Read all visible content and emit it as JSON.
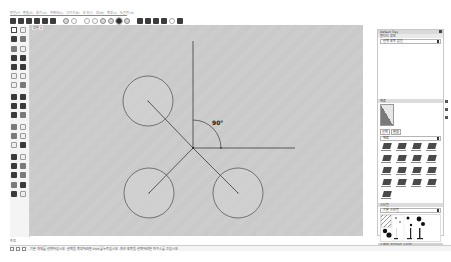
{
  "app": {
    "name": "SketchUp",
    "language": "ko"
  },
  "menubar": {
    "items": [
      "파일(F)",
      "편집(E)",
      "보기(V)",
      "카메라(C)",
      "그리기(R)",
      "도구(T)",
      "창(W)",
      "확장(x)",
      "도움말(H)"
    ]
  },
  "toolbar": {
    "buttons": [
      {
        "icon": "select-icon"
      },
      {
        "icon": "make-component-icon"
      },
      {
        "icon": "eraser-icon"
      },
      {
        "icon": "paint-bucket-icon"
      },
      {
        "icon": "line-icon"
      },
      {
        "icon": "rectangle-icon"
      },
      {
        "icon": "orbit-icon"
      },
      {
        "icon": "pan-icon"
      },
      {
        "icon": "zoom-icon"
      },
      {
        "icon": "zoom-window-icon"
      },
      {
        "icon": "zoom-extents-icon"
      },
      {
        "icon": "prev-view-icon"
      },
      {
        "icon": "position-camera-icon",
        "selected": true
      },
      {
        "icon": "walk-icon"
      },
      {
        "icon": "3d-warehouse-icon"
      },
      {
        "icon": "extension-warehouse-icon"
      },
      {
        "icon": "layout-icon"
      },
      {
        "icon": "print-icon"
      },
      {
        "icon": "home-icon"
      },
      {
        "icon": "styles-icon"
      }
    ]
  },
  "canvas": {
    "scene_tab": "장면 1",
    "background": "#cbcbcb",
    "angle_label": "90°",
    "geometry": {
      "origin": [
        163,
        123
      ],
      "vertical_line": {
        "x": 163,
        "y1": 16,
        "y2": 123
      },
      "horizontal_line": {
        "x1": 163,
        "x2": 265,
        "y": 123
      },
      "circles": [
        {
          "name": "circle-top-left",
          "cx": 118,
          "cy": 76,
          "r": 25
        },
        {
          "name": "circle-bottom-left",
          "cx": 119,
          "cy": 168,
          "r": 25
        },
        {
          "name": "circle-bottom-right",
          "cx": 208,
          "cy": 168,
          "r": 25
        }
      ]
    }
  },
  "tray": {
    "title": "Default Tray",
    "entity_info": {
      "header": "엔티티 정보",
      "value": "선택 항목 없음"
    },
    "materials": {
      "header": "재료",
      "tabs": [
        "선택",
        "편집"
      ],
      "category": "재료"
    },
    "styles": {
      "header": "스타일",
      "category": "기본 스타일",
      "footer": "스케치 가장자리 스타일"
    }
  },
  "status": {
    "label": "측정",
    "message": "기본 개체를 선택하십시오. 선택을 확장하려면 Shift를 누르십시오. 여러 항목을 선택하려면 마우스를 끄십시오."
  }
}
